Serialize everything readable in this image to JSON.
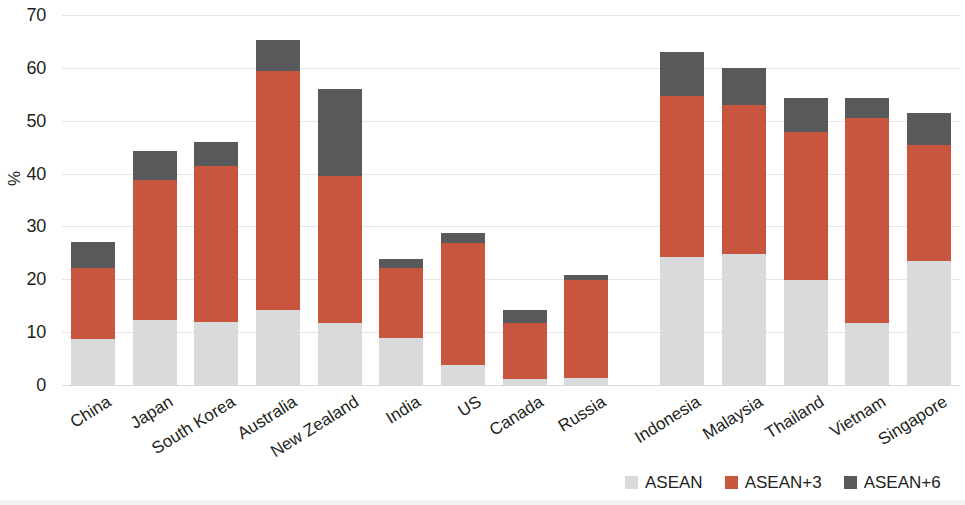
{
  "chart_data": {
    "type": "bar",
    "stacked": true,
    "title": "",
    "subtitle": "",
    "xlabel": "",
    "ylabel": "%",
    "ylim": [
      0,
      70
    ],
    "yticks": [
      0,
      10,
      20,
      30,
      40,
      50,
      60,
      70
    ],
    "ytick_labels": [
      "0",
      "10",
      "20",
      "30",
      "40",
      "50",
      "60",
      "70"
    ],
    "grid": true,
    "grid_axis": "y",
    "legend_position": "bottom-right",
    "categories": [
      "China",
      "Japan",
      "South Korea",
      "Australia",
      "New Zealand",
      "India",
      "US",
      "Canada",
      "Russia",
      "Indonesia",
      "Malaysia",
      "Thailand",
      "Vietnam",
      "Singapore"
    ],
    "series": [
      {
        "name": "ASEAN",
        "color": "#d9dadb",
        "values": [
          8.7,
          12.3,
          12.0,
          14.2,
          11.7,
          8.9,
          3.8,
          1.1,
          1.3,
          24.2,
          24.8,
          19.8,
          11.7,
          23.4
        ]
      },
      {
        "name": "ASEAN+3",
        "color": "#c8553d",
        "values": [
          13.4,
          26.4,
          29.4,
          45.3,
          27.8,
          13.2,
          23.0,
          10.6,
          18.5,
          30.4,
          28.1,
          28.0,
          38.8,
          22.0
        ]
      },
      {
        "name": "ASEAN+6",
        "color": "#58595b",
        "values": [
          5.0,
          5.5,
          4.6,
          5.7,
          16.5,
          1.7,
          1.9,
          2.5,
          1.0,
          8.4,
          7.0,
          6.5,
          3.8,
          6.0
        ]
      }
    ],
    "totals": [
      27.1,
      44.2,
      46.0,
      65.2,
      56.0,
      23.8,
      28.7,
      14.2,
      20.8,
      63.0,
      59.9,
      54.3,
      54.3,
      51.4
    ],
    "cumulative_tops": {
      "asean": [
        8.7,
        12.3,
        12.0,
        14.2,
        11.7,
        8.9,
        3.8,
        1.1,
        1.3,
        24.2,
        24.8,
        19.8,
        11.7,
        23.4
      ],
      "asean3": [
        22.1,
        38.7,
        41.4,
        59.5,
        39.5,
        22.1,
        26.8,
        11.7,
        19.8,
        54.6,
        52.9,
        47.8,
        50.5,
        45.4
      ],
      "asean6": [
        27.1,
        44.2,
        46.0,
        65.2,
        56.0,
        23.8,
        28.7,
        14.2,
        20.8,
        63.0,
        59.9,
        54.3,
        54.3,
        51.4
      ]
    }
  },
  "legend": {
    "items": [
      {
        "label": "ASEAN",
        "color": "#d9dadb"
      },
      {
        "label": "ASEAN+3",
        "color": "#c8553d"
      },
      {
        "label": "ASEAN+6",
        "color": "#58595b"
      }
    ]
  },
  "axis": {
    "y_title": "%"
  },
  "colors": {
    "asean": "#d9dadb",
    "asean_plus_3": "#c8553d",
    "asean_plus_6": "#58595b",
    "gridline": "#e3e5ea",
    "text": "#231f20",
    "background": "#ffffff"
  }
}
